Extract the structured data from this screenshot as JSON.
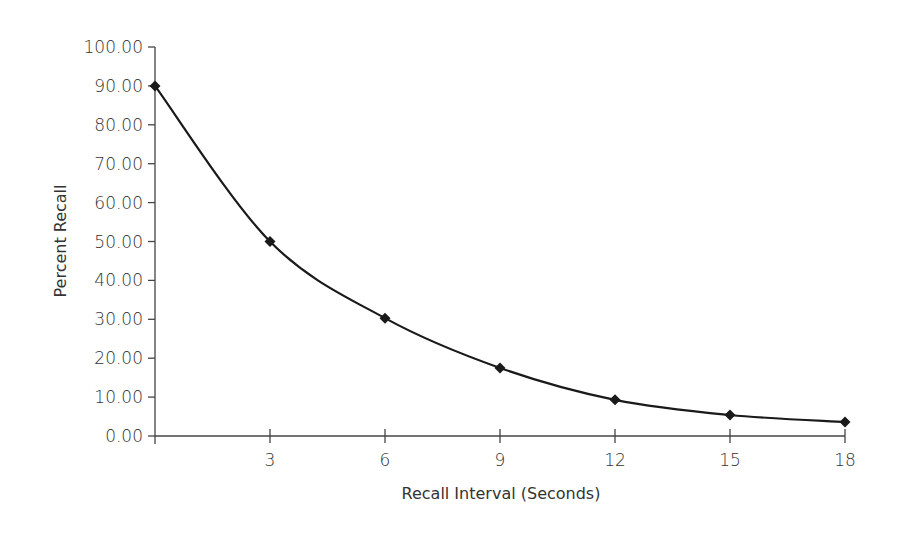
{
  "chart_data": {
    "type": "line",
    "title": "",
    "xlabel": "Recall Interval (Seconds)",
    "ylabel": "Percent  Recall",
    "x": [
      0,
      3,
      6,
      9,
      12,
      15,
      18
    ],
    "series": [
      {
        "name": "Percent Recall",
        "values": [
          90.0,
          50.0,
          30.3,
          17.5,
          9.3,
          5.4,
          3.6
        ],
        "marker": "diamond",
        "smooth": true,
        "color": "#1a1a1a"
      }
    ],
    "xlim": [
      0,
      18
    ],
    "ylim": [
      0,
      100
    ],
    "x_ticks": [
      3,
      6,
      9,
      12,
      15,
      18
    ],
    "x_tick_labels": [
      "3",
      "6",
      "9",
      "12",
      "15",
      "18"
    ],
    "y_ticks": [
      0,
      10,
      20,
      30,
      40,
      50,
      60,
      70,
      80,
      90,
      100
    ],
    "y_tick_labels": [
      "0.00",
      "10.00",
      "20.00",
      "30.00",
      "40.00",
      "50.00",
      "60.00",
      "70.00",
      "80.00",
      "90.00",
      "100.00"
    ],
    "grid": false,
    "legend": "none"
  }
}
